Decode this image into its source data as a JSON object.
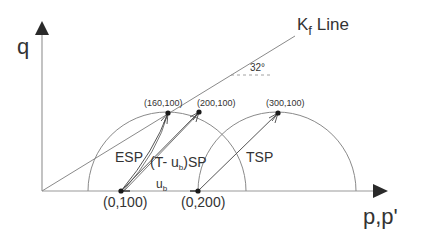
{
  "axes": {
    "y_label": "q",
    "x_label": "p,p'"
  },
  "kf_line": {
    "label_main": "K",
    "label_sub": "f",
    "label_suffix": " Line",
    "angle_label": "32°"
  },
  "points": {
    "p0_100": "(0,100)",
    "p0_200": "(0,200)",
    "p160_100": "(160,100)",
    "p200_100": "(200,100)",
    "p300_100": "(300,100)"
  },
  "paths": {
    "esp": "ESP",
    "tusp_prefix": "(T- u",
    "tusp_sub": "b",
    "tusp_suffix": ")SP",
    "tsp": "TSP"
  },
  "pore_pressure": {
    "main": "u",
    "sub": "b"
  },
  "colors": {
    "line": "#8a8a8a",
    "axis": "#9a9a9a",
    "arrow": "#2a2a2a",
    "text": "#333333"
  }
}
